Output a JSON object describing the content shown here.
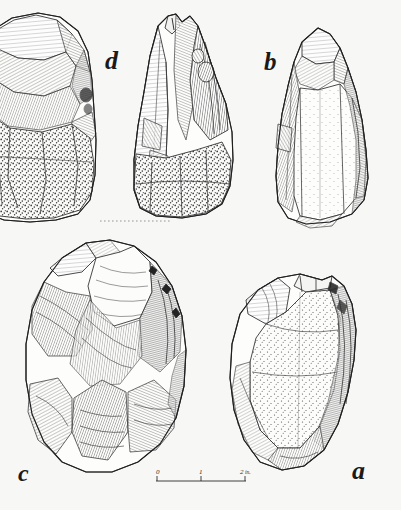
{
  "plate": {
    "medium": "ink-line-drawing",
    "background_color": "#f7f7f6",
    "ink_color": "#2b2b2b",
    "width_px": 401,
    "height_px": 510,
    "subject": "four flaked stone artefacts (handaxes / bifacial cores)"
  },
  "labels": [
    {
      "id": "d",
      "text": "d",
      "x": 105,
      "y": 48,
      "refers_to": "upper-left and upper-centre specimens"
    },
    {
      "id": "b",
      "text": "b",
      "x": 264,
      "y": 49,
      "refers_to": "upper-right pointed biface"
    },
    {
      "id": "c",
      "text": "c",
      "x": 18,
      "y": 461,
      "refers_to": "lower-left ovate biface"
    },
    {
      "id": "a",
      "text": "a",
      "x": 352,
      "y": 458,
      "refers_to": "lower-right rounded core"
    }
  ],
  "specimens": [
    {
      "label": "d",
      "position": "upper-left",
      "note": "cropped at left edge of plate",
      "description": "elongated biface, broad flake scars at top, coarse stippled cortex over lower body"
    },
    {
      "label": "d",
      "position": "upper-centre",
      "description": "narrow pointed biface with deep fan of hatched flake scars and stippled butt"
    },
    {
      "label": "b",
      "position": "upper-right",
      "description": "pointed handaxe, fine stipple on central face, hatched shading along both margins"
    },
    {
      "label": "c",
      "position": "lower-left",
      "description": "ovate biface with large radiating flake scars rendered in dense line hatching"
    },
    {
      "label": "a",
      "position": "lower-right",
      "description": "rounded discoidal core, heavy stipple on the face, hatched flaking round the rim"
    }
  ],
  "scale_bar": {
    "unit": "in.",
    "unit_label": "in.",
    "ticks": [
      "0",
      "1",
      "2"
    ],
    "x_start": 152,
    "x_end": 252,
    "y": 481
  },
  "guide_line": {
    "style": "dotted",
    "x_start": 100,
    "x_end": 170,
    "y": 221
  }
}
